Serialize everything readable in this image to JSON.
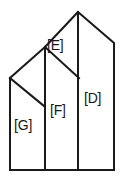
{
  "figure": {
    "name": "house-shape-partition-diagram",
    "background_color": "#ffffff",
    "stroke_color": "#1a1a1a",
    "stroke_width": 2,
    "width": 127,
    "height": 183,
    "regions": [
      {
        "id": "E",
        "label": "[E]",
        "x": 47,
        "y": 38
      },
      {
        "id": "F",
        "label": "[F]",
        "x": 50,
        "y": 103
      },
      {
        "id": "D",
        "label": "[D]",
        "x": 84,
        "y": 91
      },
      {
        "id": "G",
        "label": "[G]",
        "x": 14,
        "y": 118
      }
    ],
    "vertices": {
      "apex": [
        78,
        12
      ],
      "right_shoulder": [
        114,
        43
      ],
      "right_bottom": [
        114,
        170
      ],
      "left_bottom": [
        10,
        170
      ],
      "left_top": [
        10,
        78
      ],
      "gable_g_peak": [
        11,
        78
      ],
      "gable_f_peak": [
        45,
        47
      ]
    },
    "paths": {
      "outline": "M 78 12 L 114 43 L 114 170 L 10 170 L 10 78 L 45 47 Z",
      "divider_d_left": "M 78 12 L 78 170",
      "divider_f_left": "M 45 47 L 45 170",
      "diagonal_e_f": "M 45 47 L 79 78",
      "diagonal_g_roof": "M 10 78 L 44 106"
    }
  }
}
